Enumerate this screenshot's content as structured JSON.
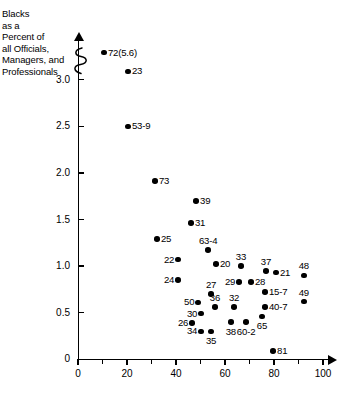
{
  "chart_data": {
    "type": "scatter",
    "title": "",
    "ylabel": "Blacks\nas a\nPercent of\nall Officials,\nManagers, and\nProfessionals",
    "xlabel": "",
    "xlim": [
      0,
      100
    ],
    "ylim": [
      0,
      3.25
    ],
    "grid": false,
    "legend": null,
    "y_axis_break": true,
    "y_ticks": [
      "3.0",
      "2.5",
      "2.0",
      "1.5",
      "1.0",
      "0.5",
      "0"
    ],
    "y_tick_values": [
      3.0,
      2.5,
      2.0,
      1.5,
      1.0,
      0.5,
      0
    ],
    "x_ticks": [
      "0",
      "20",
      "40",
      "60",
      "80",
      "100"
    ],
    "x_tick_values": [
      0,
      20,
      40,
      60,
      80,
      100
    ],
    "x_minor_ticks": [
      10,
      30,
      50,
      70,
      90
    ],
    "point_color": "#000000",
    "points": [
      {
        "label": "72(5.6)",
        "x": 10.6,
        "y": 3.29,
        "pos": "r"
      },
      {
        "label": "23",
        "x": 20.4,
        "y": 3.09,
        "pos": "r"
      },
      {
        "label": "53-9",
        "x": 20.4,
        "y": 2.5,
        "pos": "r"
      },
      {
        "label": "73",
        "x": 31.4,
        "y": 1.91,
        "pos": "r"
      },
      {
        "label": "39",
        "x": 48.2,
        "y": 1.7,
        "pos": "r"
      },
      {
        "label": "31",
        "x": 46.1,
        "y": 1.46,
        "pos": "r"
      },
      {
        "label": "25",
        "x": 32.2,
        "y": 1.29,
        "pos": "r"
      },
      {
        "label": "63-4",
        "x": 53.1,
        "y": 1.17,
        "pos": "t"
      },
      {
        "label": "22",
        "x": 40.8,
        "y": 1.07,
        "pos": "l"
      },
      {
        "label": "20",
        "x": 56.3,
        "y": 1.02,
        "pos": "r"
      },
      {
        "label": "33",
        "x": 66.5,
        "y": 1.0,
        "pos": "t"
      },
      {
        "label": "37",
        "x": 76.7,
        "y": 0.95,
        "pos": "t"
      },
      {
        "label": "21",
        "x": 80.8,
        "y": 0.93,
        "pos": "r"
      },
      {
        "label": "48",
        "x": 92.2,
        "y": 0.9,
        "pos": "t"
      },
      {
        "label": "24",
        "x": 40.8,
        "y": 0.85,
        "pos": "l"
      },
      {
        "label": "29",
        "x": 65.7,
        "y": 0.83,
        "pos": "l"
      },
      {
        "label": "28",
        "x": 70.6,
        "y": 0.83,
        "pos": "r"
      },
      {
        "label": "27",
        "x": 54.3,
        "y": 0.7,
        "pos": "t"
      },
      {
        "label": "15-7",
        "x": 76.3,
        "y": 0.72,
        "pos": "r"
      },
      {
        "label": "49",
        "x": 92.2,
        "y": 0.62,
        "pos": "t"
      },
      {
        "label": "50",
        "x": 49.0,
        "y": 0.61,
        "pos": "l"
      },
      {
        "label": "36",
        "x": 55.9,
        "y": 0.56,
        "pos": "t"
      },
      {
        "label": "32",
        "x": 63.7,
        "y": 0.56,
        "pos": "t"
      },
      {
        "label": "40-7",
        "x": 76.3,
        "y": 0.56,
        "pos": "r"
      },
      {
        "label": "30",
        "x": 50.2,
        "y": 0.49,
        "pos": "l"
      },
      {
        "label": "65",
        "x": 75.1,
        "y": 0.46,
        "pos": "b"
      },
      {
        "label": "26",
        "x": 46.5,
        "y": 0.39,
        "pos": "l"
      },
      {
        "label": "38",
        "x": 62.4,
        "y": 0.4,
        "pos": "b"
      },
      {
        "label": "60-2",
        "x": 68.6,
        "y": 0.4,
        "pos": "b"
      },
      {
        "label": "34",
        "x": 50.2,
        "y": 0.3,
        "pos": "l"
      },
      {
        "label": "35",
        "x": 54.3,
        "y": 0.3,
        "pos": "b"
      },
      {
        "label": "81",
        "x": 79.6,
        "y": 0.09,
        "pos": "r"
      }
    ]
  }
}
